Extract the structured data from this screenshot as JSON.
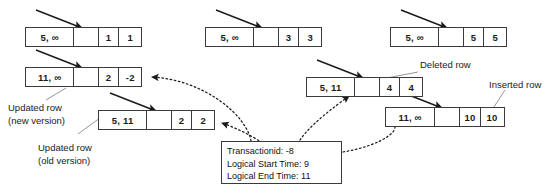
{
  "diagram": {
    "rows": [
      {
        "id": "row-a-top",
        "timestamps": "5, ∞",
        "gap": "",
        "value_1": "1",
        "value_2": "1"
      },
      {
        "id": "row-b-top",
        "timestamps": "5, ∞",
        "gap": "",
        "value_1": "3",
        "value_2": "3"
      },
      {
        "id": "row-c-top",
        "timestamps": "5, ∞",
        "gap": "",
        "value_1": "5",
        "value_2": "5"
      },
      {
        "id": "row-updated-new",
        "timestamps": "11, ∞",
        "gap": "",
        "value_1": "2",
        "value_2": "-2"
      },
      {
        "id": "row-deleted",
        "timestamps": "5, 11",
        "gap": "",
        "value_1": "4",
        "value_2": "4"
      },
      {
        "id": "row-updated-old",
        "timestamps": "5, 11",
        "gap": "",
        "value_1": "2",
        "value_2": "2"
      },
      {
        "id": "row-inserted",
        "timestamps": "11, ∞",
        "gap": "",
        "value_1": "10",
        "value_2": "10"
      }
    ],
    "labels": {
      "updated_new_line1": "Updated row",
      "updated_new_line2": "(new version)",
      "updated_old_line1": "Updated row",
      "updated_old_line2": "(old version)",
      "deleted_row": "Deleted row",
      "inserted_row": "Inserted row"
    },
    "transaction_box": {
      "transaction_id": "Transactionid: -8",
      "logical_start_time": "Logical Start Time: 9",
      "logical_end_time": "Logical End Time: 11"
    },
    "colors": {
      "stroke": "#3b3b3b",
      "text": "#1a1a1a",
      "background": "#ffffff",
      "leader_line": "#8a8a8a"
    }
  }
}
